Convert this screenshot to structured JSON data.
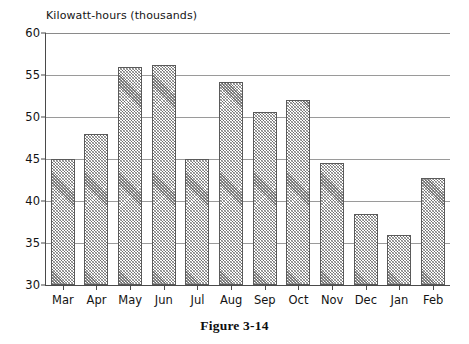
{
  "figure": {
    "caption": "Figure 3-14"
  },
  "chart_data": {
    "type": "bar",
    "title": "Kilowatt-hours (thousands)",
    "xlabel": "",
    "ylabel": "Kilowatt-hours (thousands)",
    "categories": [
      "Mar",
      "Apr",
      "May",
      "Jun",
      "Jul",
      "Aug",
      "Sep",
      "Oct",
      "Nov",
      "Dec",
      "Jan",
      "Feb"
    ],
    "values": [
      45.0,
      48.0,
      55.9,
      56.2,
      45.0,
      54.2,
      50.6,
      52.0,
      44.5,
      38.4,
      35.9,
      42.7
    ],
    "ylim": [
      30,
      60
    ],
    "yticks": [
      30,
      35,
      40,
      45,
      50,
      55,
      60
    ],
    "ytick_labels": [
      "30",
      "35",
      "40",
      "45",
      "50",
      "55",
      "60"
    ],
    "grid": true,
    "grid_axis": "y",
    "legend": false,
    "bar_fill": "hatched-crosshatch",
    "bar_edge_color": "#5a5a5a",
    "axis_color": "#4a4a4a",
    "grid_color": "#9a9a9a",
    "background": "#ffffff"
  }
}
